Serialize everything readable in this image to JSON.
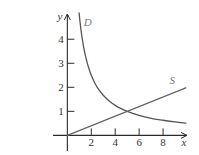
{
  "chart_data": {
    "type": "line",
    "title": "",
    "xlabel": "x",
    "ylabel": "y",
    "xlim": [
      -1.2,
      10
    ],
    "ylim": [
      -0.65,
      5.05
    ],
    "x_ticks": [
      2,
      4,
      6,
      8
    ],
    "x_tick_labels": [
      "2",
      "4",
      "6",
      "8"
    ],
    "y_ticks": [
      1,
      2,
      3,
      4
    ],
    "y_tick_labels": [
      "1",
      "2",
      "3",
      "4"
    ],
    "grid": false,
    "legend": "none",
    "series": [
      {
        "name": "D",
        "description": "demand curve, approximately y = 5/x",
        "color": "#555555",
        "x": [
          0.98,
          1.05,
          1.15,
          1.25,
          1.4,
          1.6,
          1.8,
          2.0,
          2.3,
          2.6,
          3.0,
          3.5,
          4.0,
          4.5,
          5.0,
          6.0,
          7.0,
          8.0,
          9.0,
          9.9
        ],
        "y": [
          5.1,
          4.76,
          4.35,
          4.0,
          3.57,
          3.13,
          2.78,
          2.5,
          2.17,
          1.92,
          1.67,
          1.43,
          1.25,
          1.11,
          1.0,
          0.83,
          0.71,
          0.63,
          0.56,
          0.51
        ]
      },
      {
        "name": "S",
        "description": "supply line, y = x/5",
        "color": "#666666",
        "x": [
          0,
          9.9
        ],
        "y": [
          0,
          1.98
        ]
      }
    ],
    "annotations": [
      {
        "text": "D",
        "x": 1.7,
        "y": 4.72
      },
      {
        "text": "S",
        "x": 8.77,
        "y": 2.3
      }
    ],
    "intersection": {
      "x": 5,
      "y": 1
    }
  }
}
